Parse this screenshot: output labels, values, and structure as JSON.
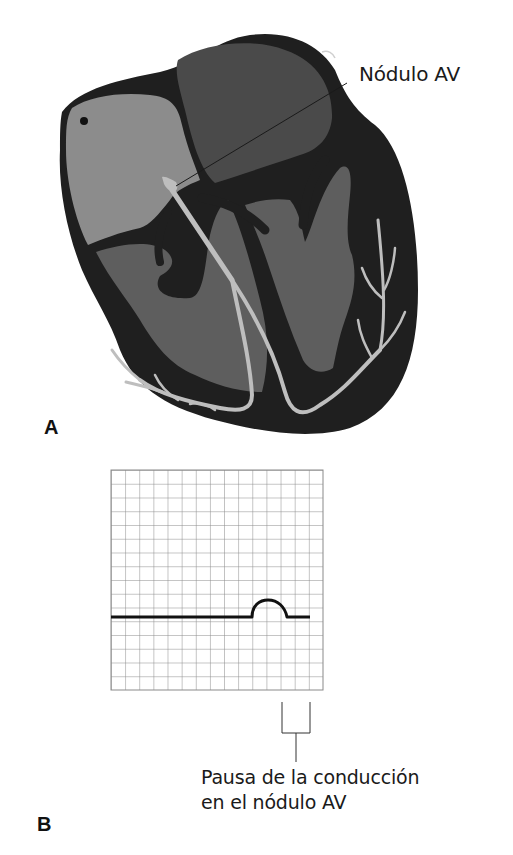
{
  "figure": {
    "panel_a": {
      "letter": "A",
      "annotation": "Nódulo AV"
    },
    "panel_b": {
      "letter": "B",
      "annotation_line1": "Pausa de la conducción",
      "annotation_line2": "en el nódulo AV"
    }
  },
  "colors": {
    "myocardium": "#1f1f1f",
    "right_atrium": "#8c8c8c",
    "left_atrium": "#4a4a4a",
    "ventricles": "#5e5e5e",
    "conduction": "#bebebe",
    "grid": "#8a8a8a",
    "trace": "#111111"
  },
  "ecg": {
    "grid_columns": 15,
    "grid_rows": 16,
    "trace_description": "flat baseline followed by a small P wave, then flat line (no QRS) - conduction pause at AV node"
  }
}
